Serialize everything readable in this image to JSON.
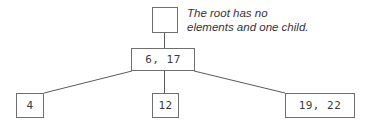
{
  "diagram": {
    "type": "tree-diagram",
    "background_color": "#ffffff",
    "node_border_color": "#6f6f6f",
    "edge_color": "#5a5a5a",
    "text_color": "#3a3a3a",
    "annotation": {
      "line1": "The root has no",
      "line2": "elements and one child.",
      "color": "#33333a",
      "style": "italic"
    },
    "nodes": {
      "root": {
        "label": "",
        "name": "root-node"
      },
      "internal": {
        "label": "6, 17",
        "name": "internal-node"
      },
      "leaves": [
        {
          "label": "4",
          "name": "leaf-node-4"
        },
        {
          "label": "12",
          "name": "leaf-node-12"
        },
        {
          "label": "19, 22",
          "name": "leaf-node-19-22"
        }
      ]
    },
    "edges": [
      {
        "from": "root",
        "to": "internal"
      },
      {
        "from": "internal",
        "to": "leaf-0"
      },
      {
        "from": "internal",
        "to": "leaf-1"
      },
      {
        "from": "internal",
        "to": "leaf-2"
      }
    ]
  }
}
